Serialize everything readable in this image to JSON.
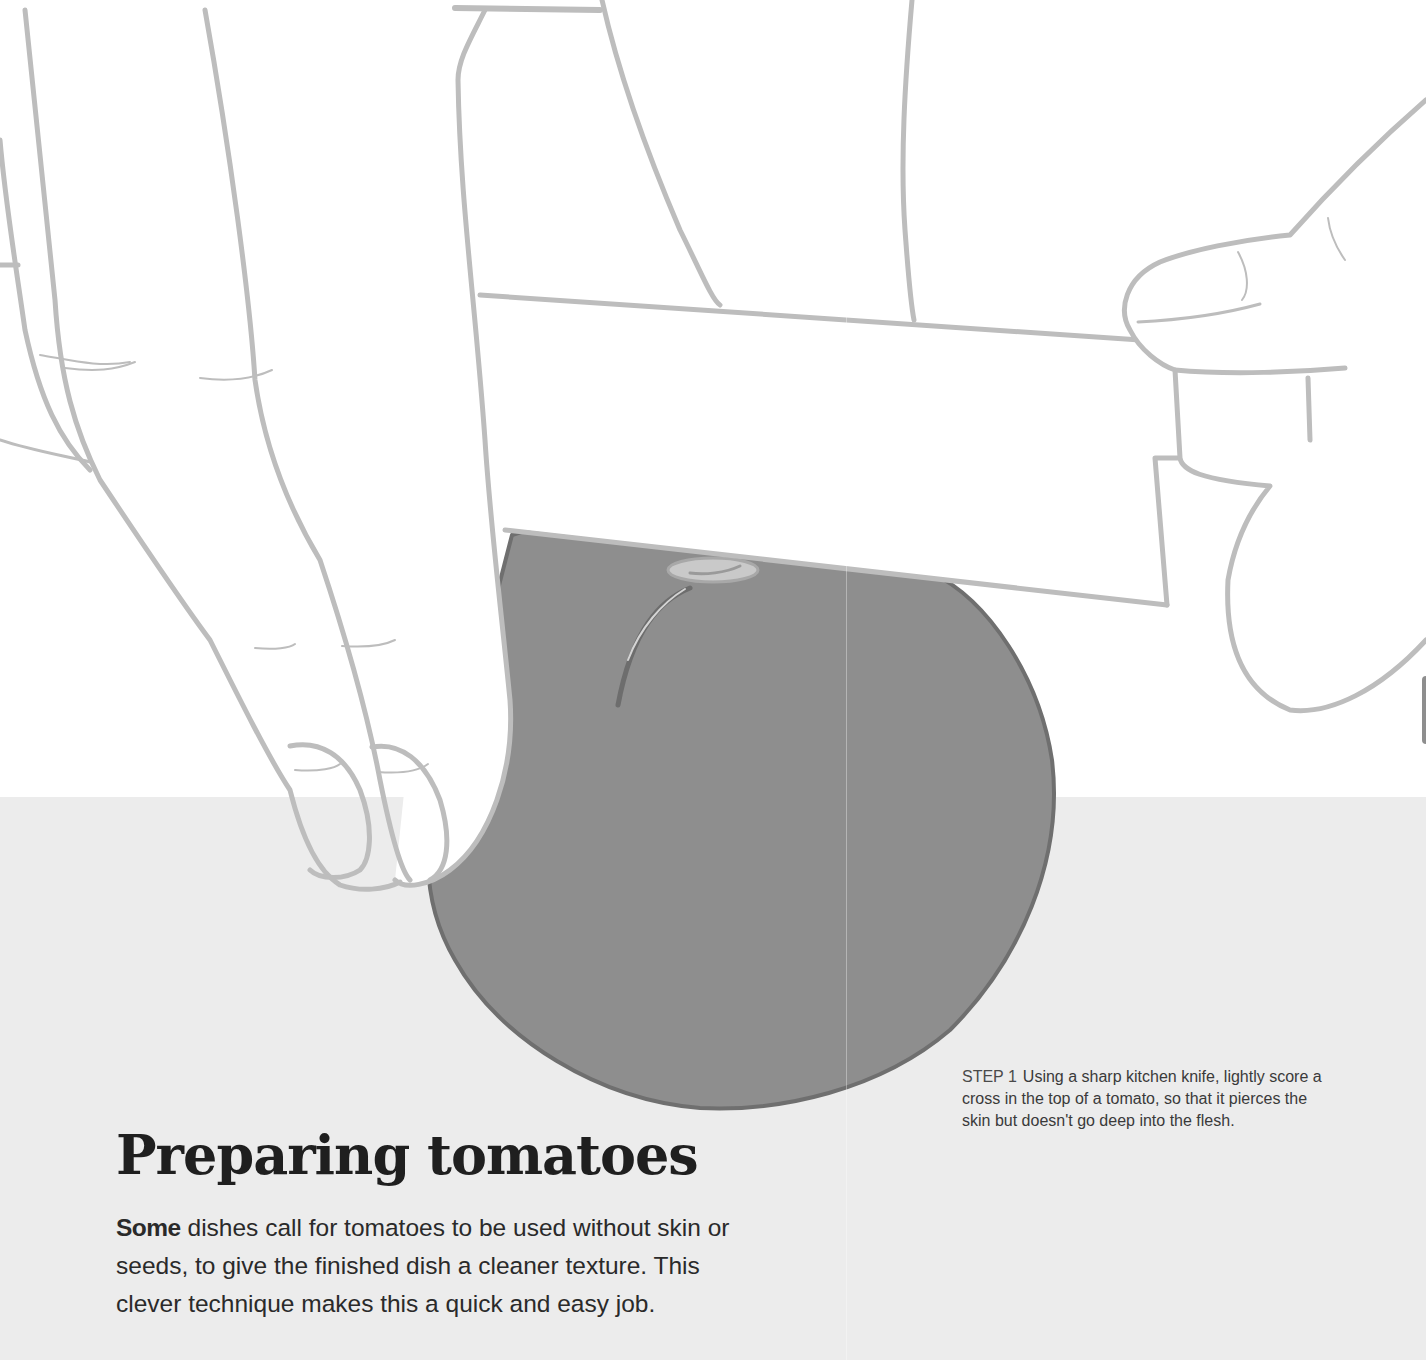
{
  "page": {
    "title": "Preparing tomatoes",
    "intro": {
      "lead_word": "Some",
      "text": " dishes call for tomatoes to be used without skin or seeds, to give the finished dish a cleaner texture. This clever technique makes this a quick and easy job."
    },
    "steps": [
      {
        "label": "STEP 1",
        "text": "Using a sharp kitchen knife, lightly score a cross in the top of a tomato, so that it pierces the skin but doesn't go deep into the flesh."
      }
    ]
  },
  "illustration": {
    "subject": "hands-scoring-tomato-with-knife",
    "colors": {
      "outline": "#bdbdbd",
      "tomato_fill": "#8e8e8e",
      "tomato_edge": "#6f6f6f",
      "stem": "#c4c4c4",
      "background_top": "#ffffff",
      "background_bottom": "#ececec"
    }
  }
}
